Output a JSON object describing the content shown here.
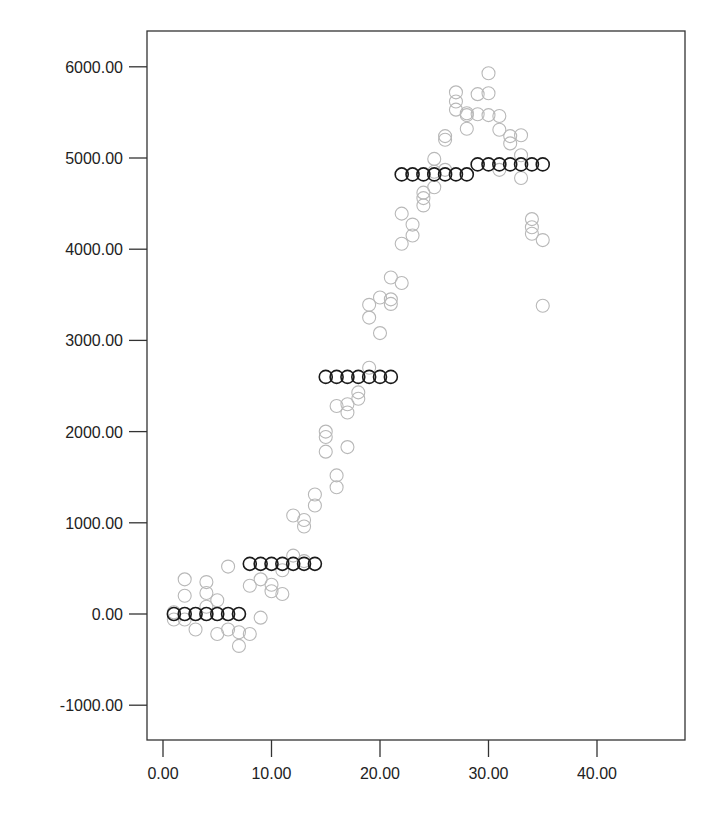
{
  "chart_data": {
    "type": "scatter",
    "title": "",
    "xlabel": "",
    "ylabel": "",
    "xlim": [
      -1.5,
      42.5
    ],
    "ylim": [
      -1400,
      6300
    ],
    "grid": false,
    "legend": null,
    "x_ticks": [
      0,
      10,
      20,
      30,
      40
    ],
    "x_tick_labels": [
      "0.00",
      "10.00",
      "20.00",
      "30.00",
      "40.00"
    ],
    "y_ticks": [
      6000,
      5000,
      4000,
      3000,
      2000,
      1000,
      0,
      -1000
    ],
    "y_tick_labels": [
      "6000.00",
      "5000.00",
      "4000.00",
      "3000.00",
      "2000.00",
      "1000.00",
      "0.00",
      "-1000.00"
    ],
    "series": [
      {
        "name": "observed",
        "marker": "open-circle",
        "color": "#b8b8b8",
        "points": [
          [
            1,
            -60
          ],
          [
            1,
            20
          ],
          [
            2,
            380
          ],
          [
            2,
            200
          ],
          [
            2,
            -60
          ],
          [
            3,
            0
          ],
          [
            3,
            -170
          ],
          [
            4,
            350
          ],
          [
            4,
            230
          ],
          [
            4,
            80
          ],
          [
            5,
            150
          ],
          [
            5,
            -220
          ],
          [
            6,
            520
          ],
          [
            6,
            -170
          ],
          [
            7,
            -200
          ],
          [
            7,
            -350
          ],
          [
            8,
            -220
          ],
          [
            8,
            310
          ],
          [
            9,
            -40
          ],
          [
            9,
            380
          ],
          [
            10,
            320
          ],
          [
            10,
            250
          ],
          [
            11,
            220
          ],
          [
            11,
            480
          ],
          [
            12,
            640
          ],
          [
            12,
            1080
          ],
          [
            13,
            580
          ],
          [
            13,
            1030
          ],
          [
            13,
            960
          ],
          [
            14,
            1190
          ],
          [
            14,
            1310
          ],
          [
            15,
            1780
          ],
          [
            15,
            1940
          ],
          [
            15,
            2000
          ],
          [
            16,
            1390
          ],
          [
            16,
            1520
          ],
          [
            16,
            2280
          ],
          [
            17,
            1830
          ],
          [
            17,
            2210
          ],
          [
            17,
            2300
          ],
          [
            18,
            2360
          ],
          [
            18,
            2430
          ],
          [
            19,
            2700
          ],
          [
            19,
            3250
          ],
          [
            19,
            3390
          ],
          [
            20,
            3080
          ],
          [
            20,
            3470
          ],
          [
            21,
            3400
          ],
          [
            21,
            3450
          ],
          [
            21,
            3690
          ],
          [
            22,
            3630
          ],
          [
            22,
            4060
          ],
          [
            22,
            4390
          ],
          [
            23,
            4150
          ],
          [
            23,
            4270
          ],
          [
            24,
            4480
          ],
          [
            24,
            4560
          ],
          [
            24,
            4620
          ],
          [
            25,
            4680
          ],
          [
            25,
            4850
          ],
          [
            25,
            4990
          ],
          [
            26,
            5200
          ],
          [
            26,
            5240
          ],
          [
            26,
            4870
          ],
          [
            27,
            5530
          ],
          [
            27,
            5620
          ],
          [
            27,
            5720
          ],
          [
            28,
            5320
          ],
          [
            28,
            5470
          ],
          [
            28,
            5490
          ],
          [
            29,
            5480
          ],
          [
            29,
            5700
          ],
          [
            30,
            5930
          ],
          [
            30,
            5710
          ],
          [
            30,
            5470
          ],
          [
            31,
            5310
          ],
          [
            31,
            5460
          ],
          [
            31,
            4870
          ],
          [
            32,
            5240
          ],
          [
            32,
            5160
          ],
          [
            33,
            5250
          ],
          [
            33,
            5030
          ],
          [
            33,
            4780
          ],
          [
            34,
            4330
          ],
          [
            34,
            4240
          ],
          [
            34,
            4170
          ],
          [
            35,
            4100
          ],
          [
            35,
            3380
          ]
        ]
      },
      {
        "name": "fitted",
        "marker": "open-circle",
        "color": "#1a1a1a",
        "points": [
          [
            1,
            0
          ],
          [
            2,
            0
          ],
          [
            3,
            0
          ],
          [
            4,
            0
          ],
          [
            5,
            0
          ],
          [
            6,
            0
          ],
          [
            7,
            0
          ],
          [
            8,
            550
          ],
          [
            9,
            550
          ],
          [
            10,
            550
          ],
          [
            11,
            550
          ],
          [
            12,
            550
          ],
          [
            13,
            550
          ],
          [
            14,
            550
          ],
          [
            15,
            2600
          ],
          [
            16,
            2600
          ],
          [
            17,
            2600
          ],
          [
            18,
            2600
          ],
          [
            19,
            2600
          ],
          [
            20,
            2600
          ],
          [
            21,
            2600
          ],
          [
            22,
            4820
          ],
          [
            23,
            4820
          ],
          [
            24,
            4820
          ],
          [
            25,
            4820
          ],
          [
            26,
            4820
          ],
          [
            27,
            4820
          ],
          [
            28,
            4820
          ],
          [
            29,
            4930
          ],
          [
            30,
            4930
          ],
          [
            31,
            4930
          ],
          [
            32,
            4930
          ],
          [
            33,
            4930
          ],
          [
            34,
            4930
          ],
          [
            35,
            4930
          ]
        ]
      }
    ]
  },
  "layout": {
    "plot_left": 147,
    "plot_right": 685,
    "plot_top": 31,
    "plot_bottom": 740,
    "x0_px": 163,
    "x_px_per_unit": 10.85,
    "y0_px": 614,
    "y_px_per_unit": 0.0912,
    "marker_radius": 6.5,
    "axis_color": "#333333"
  }
}
